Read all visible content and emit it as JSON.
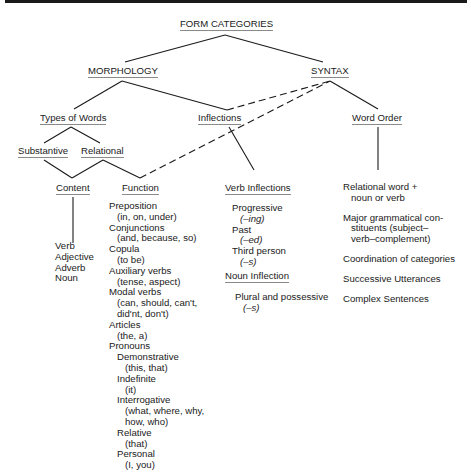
{
  "title": "FORM CATEGORIES",
  "level1": {
    "morphology": "MORPHOLOGY",
    "syntax": "SYNTAX"
  },
  "level2": {
    "types_of_words": "Types of Words",
    "inflections": "Inflections",
    "word_order": "Word Order"
  },
  "level3": {
    "substantive": "Substantive",
    "relational": "Relational"
  },
  "level4": {
    "content": "Content",
    "function": "Function",
    "verb_inflections": "Verb Inflections",
    "noun_inflection": "Noun Inflection"
  },
  "content_items": [
    "Verb",
    "Adjective",
    "Adverb",
    "Noun"
  ],
  "function_items": {
    "preposition": "Preposition",
    "preposition_ex": "(in, on, under)",
    "conjunctions": "Conjunctions",
    "conjunctions_ex": "(and, because, so)",
    "copula": "Copula",
    "copula_ex": "(to be)",
    "auxiliary": "Auxiliary verbs",
    "auxiliary_ex": "(tense, aspect)",
    "modal": "Modal verbs",
    "modal_ex1": "(can, should, can't,",
    "modal_ex2": "did'nt, don't)",
    "articles": "Articles",
    "articles_ex": "(the, a)",
    "pronouns": "Pronouns",
    "demonstrative": "Demonstrative",
    "demonstrative_ex": "(this, that)",
    "indefinite": "Indefinite",
    "indefinite_ex": "(it)",
    "interrogative": "Interrogative",
    "interrogative_ex1": "(what, where, why,",
    "interrogative_ex2": "how, who)",
    "relative": "Relative",
    "relative_ex": "(that)",
    "personal": "Personal",
    "personal_ex": "(I, you)"
  },
  "verb_inflection_items": {
    "progressive": "Progressive",
    "progressive_suffix": "(–ing)",
    "past": "Past",
    "past_suffix": "(–ed)",
    "third_person": "Third person",
    "third_person_suffix": "(–s)"
  },
  "noun_inflection_items": {
    "plural": "Plural and possessive",
    "plural_suffix": "(–s)"
  },
  "word_order_items": {
    "relational_word_1": "Relational word +",
    "relational_word_2": "noun or verb",
    "major_1": "Major grammatical con-",
    "major_2": "stituents (subject–",
    "major_3": "verb–complement)",
    "coordination": "Coordination of categories",
    "successive": "Successive Utterances",
    "complex": "Complex Sentences"
  },
  "colors": {
    "line": "#1a1a1a",
    "text": "#1a1a1a",
    "underline": "#8a8a8a"
  }
}
